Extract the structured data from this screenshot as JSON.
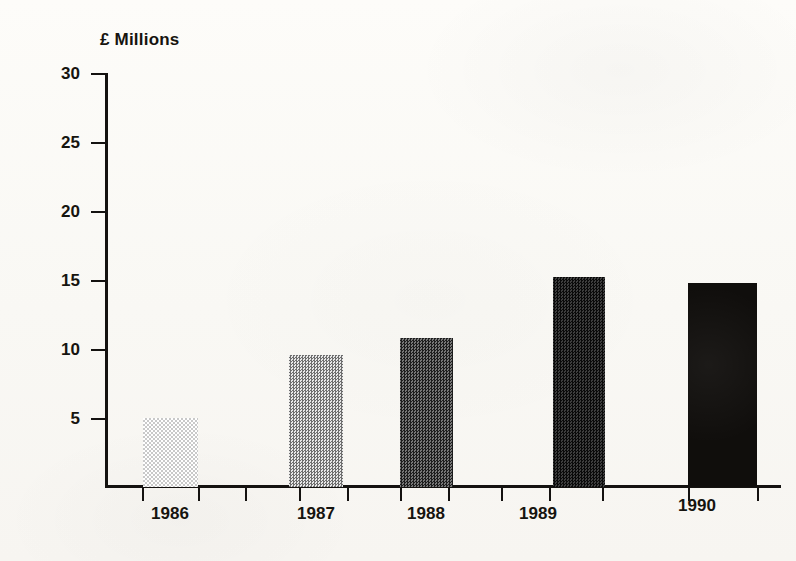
{
  "chart_data": {
    "type": "bar",
    "title": "",
    "subtitle": "",
    "ylabel": "£ Millions",
    "xlabel": "",
    "categories": [
      "1986",
      "1987",
      "1988",
      "1989",
      "1990"
    ],
    "values": [
      5.0,
      9.6,
      10.8,
      15.2,
      14.8
    ],
    "series": [
      {
        "name": "£ Millions",
        "values": [
          5.0,
          9.6,
          10.8,
          15.2,
          14.8
        ]
      }
    ],
    "ylim": [
      0,
      30
    ],
    "ytick_labels": [
      "30",
      "25",
      "20",
      "15",
      "10",
      "5"
    ],
    "ytick_values": [
      30,
      25,
      20,
      15,
      10,
      5
    ],
    "grid": false,
    "legend": null,
    "legend_position": "none",
    "annotations": [],
    "bar_fills": [
      "light-dither",
      "medium-light-dither",
      "medium-dark-dither",
      "dark-dither",
      "solid-black"
    ],
    "bar_colors": [
      "#d9d9d9",
      "#9a9a9a",
      "#4a4a4a",
      "#242424",
      "#100e0c"
    ]
  },
  "axes": {
    "y_title": "£ Millions",
    "y_ticks": [
      {
        "label": "30",
        "value": 30
      },
      {
        "label": "25",
        "value": 25
      },
      {
        "label": "20",
        "value": 20
      },
      {
        "label": "15",
        "value": 15
      },
      {
        "label": "10",
        "value": 10
      },
      {
        "label": "5",
        "value": 5
      }
    ],
    "x_ticks": [
      {
        "label": "1986"
      },
      {
        "label": "1987"
      },
      {
        "label": "1988"
      },
      {
        "label": "1989"
      },
      {
        "label": "1990"
      }
    ]
  },
  "colors": {
    "ink": "#141210",
    "paper": "#fbfaf7"
  }
}
